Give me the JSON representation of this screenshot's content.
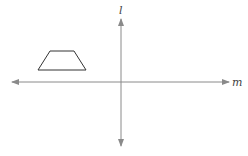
{
  "diagram": {
    "axes": {
      "vertical_label": "l",
      "horizontal_label": "m",
      "color": "#8a8a8a"
    },
    "shape": {
      "type": "trapezoid",
      "points": "50,51 74,51 86,70 38,70",
      "stroke": "#333333"
    }
  }
}
